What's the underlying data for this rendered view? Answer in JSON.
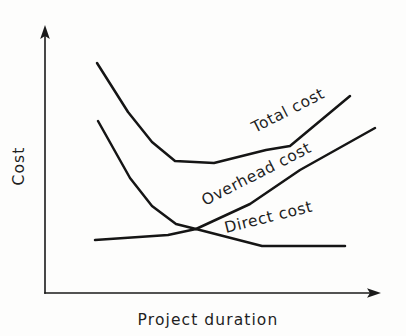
{
  "figure": {
    "background_color": "#fdfdfc",
    "ink_color": "#151515"
  },
  "axes": {
    "y_label": "Cost",
    "x_label": "Project duration",
    "y_axis_name": "cost-axis",
    "x_axis_name": "duration-axis",
    "has_tick_labels": false,
    "has_grid": false,
    "arrowheads": true
  },
  "chart_data": {
    "type": "line",
    "title": "",
    "subtitle": "",
    "xlabel": "Project duration",
    "ylabel": "Cost",
    "xlim": [
      0,
      100
    ],
    "ylim": [
      0,
      100
    ],
    "grid": false,
    "legend": "inline-labels",
    "axis_tick_labels": false,
    "note": "Schematic project-management trade-off curves: direct cost falls as duration lengthens, overhead cost rises, and total cost is the U-shaped sum with an optimum minimum duration.",
    "series": [
      {
        "name": "Total cost",
        "label": "Total cost",
        "label_rotation_deg": -27,
        "label_x": 255,
        "label_y": 133,
        "shape": "u-shaped-minimum",
        "points": [
          {
            "x": 97,
            "y": 63
          },
          {
            "x": 128,
            "y": 112
          },
          {
            "x": 152,
            "y": 142
          },
          {
            "x": 175,
            "y": 161
          },
          {
            "x": 214,
            "y": 163
          },
          {
            "x": 266,
            "y": 150
          },
          {
            "x": 290,
            "y": 146
          },
          {
            "x": 350,
            "y": 96
          }
        ]
      },
      {
        "name": "Overhead cost",
        "label": "Overhead cost",
        "label_rotation_deg": -27,
        "label_x": 205,
        "label_y": 206,
        "shape": "monotonic-rising-from-left-drop",
        "points": [
          {
            "x": 98,
            "y": 121
          },
          {
            "x": 130,
            "y": 178
          },
          {
            "x": 152,
            "y": 206
          },
          {
            "x": 176,
            "y": 224
          },
          {
            "x": 196,
            "y": 229
          },
          {
            "x": 250,
            "y": 204
          },
          {
            "x": 300,
            "y": 170
          },
          {
            "x": 375,
            "y": 128
          }
        ]
      },
      {
        "name": "Direct cost",
        "label": "Direct cost",
        "label_rotation_deg": -14,
        "label_x": 226,
        "label_y": 233,
        "shape": "declining-then-flat",
        "points": [
          {
            "x": 95,
            "y": 240
          },
          {
            "x": 168,
            "y": 235
          },
          {
            "x": 196,
            "y": 229
          },
          {
            "x": 262,
            "y": 246
          },
          {
            "x": 345,
            "y": 246
          }
        ]
      }
    ],
    "annotations": [
      {
        "name": "crossover-point",
        "x": 196,
        "y": 229,
        "text": ""
      }
    ]
  }
}
